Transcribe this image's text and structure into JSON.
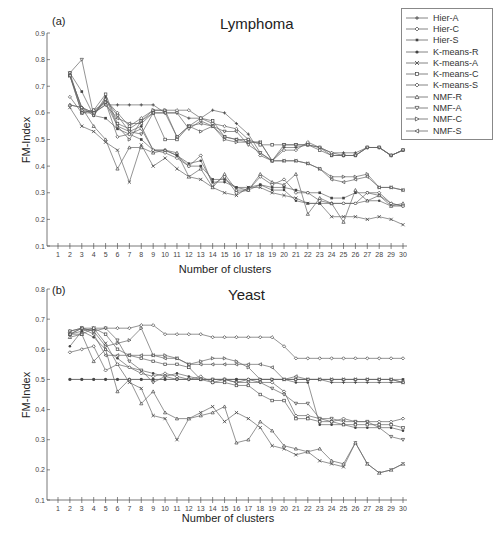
{
  "legend": {
    "items": [
      {
        "label": "Hier-A",
        "marker": "plus"
      },
      {
        "label": "Hier-C",
        "marker": "diamond"
      },
      {
        "label": "Hier-S",
        "marker": "star"
      },
      {
        "label": "K-means-R",
        "marker": "circle-filled"
      },
      {
        "label": "K-means-A",
        "marker": "cross"
      },
      {
        "label": "K-means-C",
        "marker": "square"
      },
      {
        "label": "K-means-S",
        "marker": "diamond-open"
      },
      {
        "label": "NMF-R",
        "marker": "triangle-up"
      },
      {
        "label": "NMF-A",
        "marker": "triangle-down"
      },
      {
        "label": "NMF-C",
        "marker": "triangle-right"
      },
      {
        "label": "NMF-S",
        "marker": "triangle-left"
      }
    ]
  },
  "chart_data": [
    {
      "type": "line",
      "panel": "(a)",
      "title": "Lymphoma",
      "xlabel": "Number of clusters",
      "ylabel": "FM-Index",
      "ylim": [
        0.1,
        0.9
      ],
      "yticks": [
        "0.1",
        "0.2",
        "0.3",
        "0.4",
        "0.5",
        "0.6",
        "0.7",
        "0.8",
        "0.9"
      ],
      "x": [
        2,
        3,
        4,
        5,
        6,
        7,
        8,
        9,
        10,
        11,
        12,
        13,
        14,
        15,
        16,
        17,
        18,
        19,
        20,
        21,
        22,
        23,
        24,
        25,
        26,
        27,
        28,
        29,
        30
      ],
      "xticks": [
        1,
        2,
        3,
        4,
        5,
        6,
        7,
        8,
        9,
        10,
        11,
        12,
        13,
        14,
        15,
        16,
        17,
        18,
        19,
        20,
        21,
        22,
        23,
        24,
        25,
        26,
        27,
        28,
        29,
        30
      ],
      "series": [
        {
          "name": "Hier-A",
          "values": [
            0.63,
            0.62,
            0.6,
            0.63,
            0.63,
            0.63,
            0.63,
            0.63,
            0.6,
            0.6,
            0.58,
            0.58,
            0.61,
            0.6,
            0.56,
            0.52,
            0.45,
            0.42,
            0.47,
            0.47,
            0.48,
            0.47,
            0.45,
            0.45,
            0.45,
            0.47,
            0.47,
            0.44,
            0.46
          ]
        },
        {
          "name": "Hier-C",
          "values": [
            0.75,
            0.61,
            0.6,
            0.65,
            0.6,
            0.55,
            0.58,
            0.61,
            0.61,
            0.61,
            0.61,
            0.58,
            0.56,
            0.55,
            0.54,
            0.5,
            0.44,
            0.42,
            0.46,
            0.46,
            0.49,
            0.47,
            0.45,
            0.44,
            0.44,
            0.47,
            0.47,
            0.44,
            0.46
          ]
        },
        {
          "name": "Hier-S",
          "values": [
            0.75,
            0.68,
            0.59,
            0.58,
            0.54,
            0.52,
            0.5,
            0.46,
            0.46,
            0.44,
            0.4,
            0.4,
            0.35,
            0.35,
            0.32,
            0.32,
            0.33,
            0.32,
            0.32,
            0.31,
            0.3,
            0.3,
            0.28,
            0.28,
            0.3,
            0.3,
            0.29,
            0.26,
            0.25
          ]
        },
        {
          "name": "K-means-R",
          "values": [
            0.74,
            0.62,
            0.59,
            0.66,
            0.55,
            0.53,
            0.55,
            0.46,
            0.46,
            0.44,
            0.41,
            0.42,
            0.34,
            0.34,
            0.32,
            0.31,
            0.33,
            0.31,
            0.31,
            0.27,
            0.26,
            0.26,
            0.26,
            0.26,
            0.26,
            0.27,
            0.27,
            0.25,
            0.25
          ]
        },
        {
          "name": "K-means-A",
          "values": [
            0.62,
            0.55,
            0.53,
            0.49,
            0.46,
            0.34,
            0.48,
            0.4,
            0.43,
            0.39,
            0.36,
            0.35,
            0.32,
            0.3,
            0.29,
            0.32,
            0.32,
            0.3,
            0.29,
            0.28,
            0.26,
            0.26,
            0.21,
            0.21,
            0.21,
            0.2,
            0.21,
            0.2,
            0.18
          ]
        },
        {
          "name": "K-means-C",
          "values": [
            0.74,
            0.6,
            0.61,
            0.67,
            0.56,
            0.54,
            0.57,
            0.6,
            0.5,
            0.5,
            0.55,
            0.58,
            0.57,
            0.51,
            0.5,
            0.5,
            0.48,
            0.48,
            0.48,
            0.48,
            0.48,
            0.46,
            0.44,
            0.44,
            0.44,
            0.47,
            0.47,
            0.44,
            0.46
          ]
        },
        {
          "name": "K-means-S",
          "values": [
            0.66,
            0.6,
            0.61,
            0.64,
            0.51,
            0.52,
            0.54,
            0.46,
            0.45,
            0.43,
            0.4,
            0.44,
            0.33,
            0.36,
            0.3,
            0.31,
            0.36,
            0.33,
            0.35,
            0.3,
            0.3,
            0.27,
            0.26,
            0.26,
            0.26,
            0.3,
            0.3,
            0.26,
            0.25
          ]
        },
        {
          "name": "NMF-R",
          "values": [
            0.63,
            0.62,
            0.55,
            0.5,
            0.39,
            0.47,
            0.47,
            0.45,
            0.46,
            0.45,
            0.36,
            0.39,
            0.32,
            0.37,
            0.31,
            0.31,
            0.37,
            0.34,
            0.33,
            0.37,
            0.22,
            0.28,
            0.26,
            0.19,
            0.31,
            0.27,
            0.29,
            0.25,
            0.26
          ]
        },
        {
          "name": "NMF-A",
          "values": [
            0.75,
            0.8,
            0.59,
            0.65,
            0.59,
            0.53,
            0.52,
            0.6,
            0.6,
            0.6,
            0.54,
            0.57,
            0.55,
            0.53,
            0.53,
            0.48,
            0.45,
            0.42,
            0.48,
            0.48,
            0.48,
            0.47,
            0.44,
            0.44,
            0.44,
            0.47,
            0.47,
            0.44,
            0.46
          ]
        },
        {
          "name": "NMF-C",
          "values": [
            0.74,
            0.62,
            0.6,
            0.64,
            0.55,
            0.5,
            0.57,
            0.61,
            0.61,
            0.51,
            0.55,
            0.53,
            0.55,
            0.5,
            0.49,
            0.49,
            0.49,
            0.42,
            0.42,
            0.42,
            0.41,
            0.39,
            0.36,
            0.36,
            0.36,
            0.37,
            0.32,
            0.32,
            0.31
          ]
        },
        {
          "name": "NMF-S",
          "values": [
            0.74,
            0.6,
            0.6,
            0.63,
            0.58,
            0.56,
            0.56,
            0.6,
            0.6,
            0.51,
            0.55,
            0.56,
            0.55,
            0.51,
            0.5,
            0.49,
            0.49,
            0.42,
            0.42,
            0.42,
            0.41,
            0.39,
            0.35,
            0.34,
            0.35,
            0.36,
            0.32,
            0.32,
            0.31
          ]
        }
      ]
    },
    {
      "type": "line",
      "panel": "(b)",
      "title": "Yeast",
      "xlabel": "Number of clusters",
      "ylabel": "FM-Index",
      "ylim": [
        0.1,
        0.8
      ],
      "yticks": [
        "0.1",
        "0.2",
        "0.3",
        "0.4",
        "0.5",
        "0.6",
        "0.7",
        "0.8"
      ],
      "x": [
        2,
        3,
        4,
        5,
        6,
        7,
        8,
        9,
        10,
        11,
        12,
        13,
        14,
        15,
        16,
        17,
        18,
        19,
        20,
        21,
        22,
        23,
        24,
        25,
        26,
        27,
        28,
        29,
        30
      ],
      "xticks": [
        1,
        2,
        3,
        4,
        5,
        6,
        7,
        8,
        9,
        10,
        11,
        12,
        13,
        14,
        15,
        16,
        17,
        18,
        19,
        20,
        21,
        22,
        23,
        24,
        25,
        26,
        27,
        28,
        29,
        30
      ],
      "series": [
        {
          "name": "Hier-A",
          "values": [
            0.5,
            0.5,
            0.5,
            0.5,
            0.5,
            0.5,
            0.5,
            0.5,
            0.5,
            0.5,
            0.5,
            0.5,
            0.5,
            0.5,
            0.5,
            0.5,
            0.5,
            0.5,
            0.5,
            0.5,
            0.5,
            0.5,
            0.49,
            0.49,
            0.49,
            0.49,
            0.49,
            0.49,
            0.49
          ]
        },
        {
          "name": "Hier-C",
          "values": [
            0.66,
            0.67,
            0.67,
            0.67,
            0.67,
            0.67,
            0.68,
            0.68,
            0.65,
            0.65,
            0.65,
            0.65,
            0.64,
            0.64,
            0.64,
            0.64,
            0.64,
            0.64,
            0.61,
            0.57,
            0.57,
            0.57,
            0.57,
            0.57,
            0.57,
            0.57,
            0.57,
            0.57,
            0.57
          ]
        },
        {
          "name": "Hier-S",
          "values": [
            0.5,
            0.5,
            0.5,
            0.5,
            0.5,
            0.5,
            0.5,
            0.5,
            0.5,
            0.5,
            0.5,
            0.5,
            0.5,
            0.5,
            0.5,
            0.5,
            0.5,
            0.5,
            0.5,
            0.5,
            0.5,
            0.5,
            0.5,
            0.5,
            0.5,
            0.5,
            0.5,
            0.5,
            0.5
          ]
        },
        {
          "name": "K-means-R",
          "values": [
            0.61,
            0.66,
            0.64,
            0.6,
            0.57,
            0.54,
            0.53,
            0.52,
            0.51,
            0.52,
            0.51,
            0.5,
            0.5,
            0.5,
            0.5,
            0.5,
            0.5,
            0.5,
            0.5,
            0.49,
            0.49,
            0.35,
            0.35,
            0.35,
            0.34,
            0.34,
            0.34,
            0.34,
            0.33
          ]
        },
        {
          "name": "K-means-A",
          "values": [
            0.65,
            0.66,
            0.67,
            0.62,
            0.55,
            0.49,
            0.47,
            0.38,
            0.37,
            0.3,
            0.37,
            0.39,
            0.41,
            0.36,
            0.39,
            0.37,
            0.34,
            0.28,
            0.27,
            0.25,
            0.26,
            0.23,
            0.22,
            0.21,
            0.29,
            0.22,
            0.19,
            0.2,
            0.22
          ]
        },
        {
          "name": "K-means-C",
          "values": [
            0.65,
            0.65,
            0.67,
            0.65,
            0.6,
            0.58,
            0.57,
            0.56,
            0.55,
            0.55,
            0.54,
            0.5,
            0.49,
            0.49,
            0.48,
            0.48,
            0.45,
            0.43,
            0.43,
            0.37,
            0.37,
            0.36,
            0.36,
            0.35,
            0.35,
            0.35,
            0.35,
            0.35,
            0.34
          ]
        },
        {
          "name": "K-means-S",
          "values": [
            0.59,
            0.6,
            0.61,
            0.53,
            0.55,
            0.54,
            0.52,
            0.51,
            0.52,
            0.51,
            0.5,
            0.51,
            0.49,
            0.5,
            0.49,
            0.5,
            0.49,
            0.49,
            0.46,
            0.38,
            0.38,
            0.37,
            0.36,
            0.37,
            0.36,
            0.36,
            0.36,
            0.36,
            0.37
          ]
        },
        {
          "name": "NMF-R",
          "values": [
            0.64,
            0.65,
            0.56,
            0.6,
            0.46,
            0.5,
            0.42,
            0.46,
            0.39,
            0.37,
            0.37,
            0.38,
            0.39,
            0.41,
            0.29,
            0.3,
            0.36,
            0.33,
            0.28,
            0.27,
            0.26,
            0.27,
            0.23,
            0.22,
            0.29,
            0.22,
            0.19,
            0.2,
            0.22
          ]
        },
        {
          "name": "NMF-A",
          "values": [
            0.66,
            0.67,
            0.66,
            0.67,
            0.63,
            0.56,
            0.53,
            0.49,
            0.51,
            0.5,
            0.5,
            0.5,
            0.5,
            0.5,
            0.49,
            0.49,
            0.49,
            0.47,
            0.45,
            0.42,
            0.42,
            0.37,
            0.37,
            0.36,
            0.36,
            0.36,
            0.34,
            0.31,
            0.3
          ]
        },
        {
          "name": "NMF-C",
          "values": [
            0.65,
            0.67,
            0.66,
            0.61,
            0.62,
            0.63,
            0.67,
            0.58,
            0.58,
            0.57,
            0.55,
            0.56,
            0.57,
            0.57,
            0.56,
            0.54,
            0.5,
            0.5,
            0.5,
            0.5,
            0.5,
            0.5,
            0.5,
            0.5,
            0.5,
            0.5,
            0.5,
            0.5,
            0.49
          ]
        },
        {
          "name": "NMF-S",
          "values": [
            0.65,
            0.67,
            0.65,
            0.58,
            0.58,
            0.58,
            0.58,
            0.58,
            0.57,
            0.57,
            0.55,
            0.55,
            0.55,
            0.55,
            0.55,
            0.55,
            0.55,
            0.54,
            0.5,
            0.51,
            0.5,
            0.5,
            0.5,
            0.5,
            0.5,
            0.5,
            0.5,
            0.5,
            0.49
          ]
        }
      ]
    }
  ]
}
